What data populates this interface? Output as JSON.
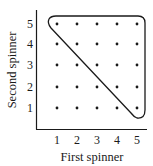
{
  "diagram": {
    "x_axis_label": "First spinner",
    "y_axis_label": "Second spinner",
    "x_ticks": [
      "1",
      "2",
      "3",
      "4",
      "5"
    ],
    "y_ticks": [
      "1",
      "2",
      "3",
      "4",
      "5"
    ],
    "grid_points": "5x5 dots, one for each outcome (first, second)",
    "highlighted_region": "rounded triangle enclosing outcomes where first + second >= 6 (upper-right triangle including anti-diagonal)"
  },
  "colors": {
    "ink": "#1a1a1a",
    "background": "#ffffff"
  }
}
